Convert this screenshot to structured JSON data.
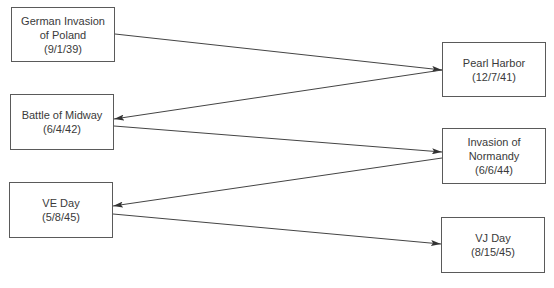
{
  "diagram": {
    "nodes": [
      {
        "id": "poland",
        "lines": [
          "German Invasion",
          "of Poland",
          "(9/1/39)"
        ]
      },
      {
        "id": "pearl",
        "lines": [
          "Pearl Harbor",
          "(12/7/41)"
        ]
      },
      {
        "id": "midway",
        "lines": [
          "Battle of Midway",
          "(6/4/42)"
        ]
      },
      {
        "id": "normandy",
        "lines": [
          "Invasion of",
          "Normandy",
          "(6/6/44)"
        ]
      },
      {
        "id": "ve",
        "lines": [
          "VE Day",
          "(5/8/45)"
        ]
      },
      {
        "id": "vj",
        "lines": [
          "VJ Day",
          "(8/15/45)"
        ]
      }
    ],
    "edges": [
      {
        "from": "poland",
        "to": "pearl"
      },
      {
        "from": "pearl",
        "to": "midway"
      },
      {
        "from": "midway",
        "to": "normandy"
      },
      {
        "from": "normandy",
        "to": "ve"
      },
      {
        "from": "ve",
        "to": "vj"
      }
    ],
    "colors": {
      "line": "#444444",
      "border": "#5a5a5a",
      "text": "#3a3a3a"
    }
  }
}
